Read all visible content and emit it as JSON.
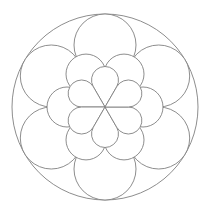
{
  "diagram": {
    "type": "mandala-line-art",
    "background": "#ffffff",
    "line_color": "#808080",
    "center": [
      105,
      107
    ],
    "outer_circle": {
      "radius": 93
    },
    "outer_lobes": {
      "count": 6,
      "distance": 62,
      "radius": 31,
      "start_angle_deg": 90
    },
    "middle_lobes": {
      "count": 6,
      "distance": 38,
      "radius": 20,
      "start_angle_deg": 0
    },
    "inner_petals": {
      "count": 6,
      "distance": 27,
      "radius": 13.5,
      "start_angle_deg": 90,
      "shape": "teardrop"
    }
  }
}
